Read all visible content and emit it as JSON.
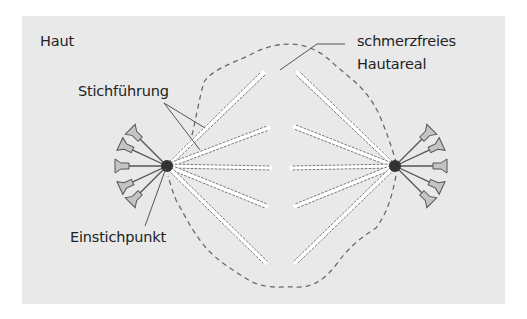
{
  "labels": {
    "skin": "Haut",
    "needle_path": "Stichführung",
    "pain_free_area_line1": "schmerzfreies",
    "pain_free_area_line2": "Hautareal",
    "insertion_point": "Einstichpunkt"
  },
  "colors": {
    "panel_bg": "#e9e9e9",
    "outline_dash": "#6a6a6a",
    "track_dash": "#777777",
    "track_fill": "#ffffff",
    "hub_dot": "#333333",
    "needle_hub_fill": "#c4c4c4",
    "needle_stroke": "#555555",
    "text": "#222222"
  },
  "injection_points": [
    {
      "side": "left",
      "x": 167,
      "y": 166
    },
    {
      "side": "right",
      "x": 395,
      "y": 166
    }
  ],
  "needle_tracks": {
    "left": [
      [
        263,
        73
      ],
      [
        268,
        128
      ],
      [
        270,
        168
      ],
      [
        266,
        206
      ],
      [
        265,
        262
      ]
    ],
    "right": [
      [
        298,
        73
      ],
      [
        295,
        127
      ],
      [
        292,
        168
      ],
      [
        296,
        206
      ],
      [
        296,
        262
      ]
    ]
  },
  "needles_per_point": 5
}
